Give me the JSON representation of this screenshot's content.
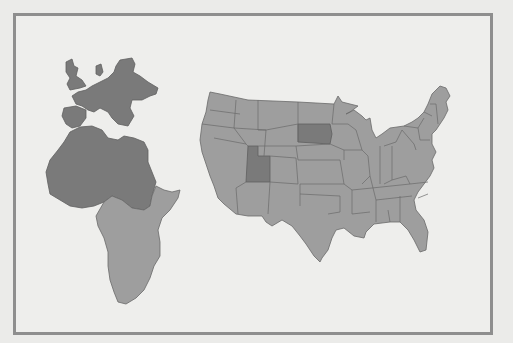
{
  "map": {
    "regions": [
      {
        "name": "Europe",
        "shade": "dark"
      },
      {
        "name": "North Africa",
        "shade": "dark"
      },
      {
        "name": "Sub-Saharan Africa",
        "shade": "light"
      },
      {
        "name": "United States",
        "shade": "light"
      }
    ],
    "highlighted_states": [
      "Utah",
      "South Dakota"
    ],
    "colors": {
      "background": "#eeeeec",
      "frame": "#8e8e8e",
      "dark_fill": "#7a7a7a",
      "light_fill": "#9e9e9e",
      "border": "#6a6a6a"
    }
  }
}
